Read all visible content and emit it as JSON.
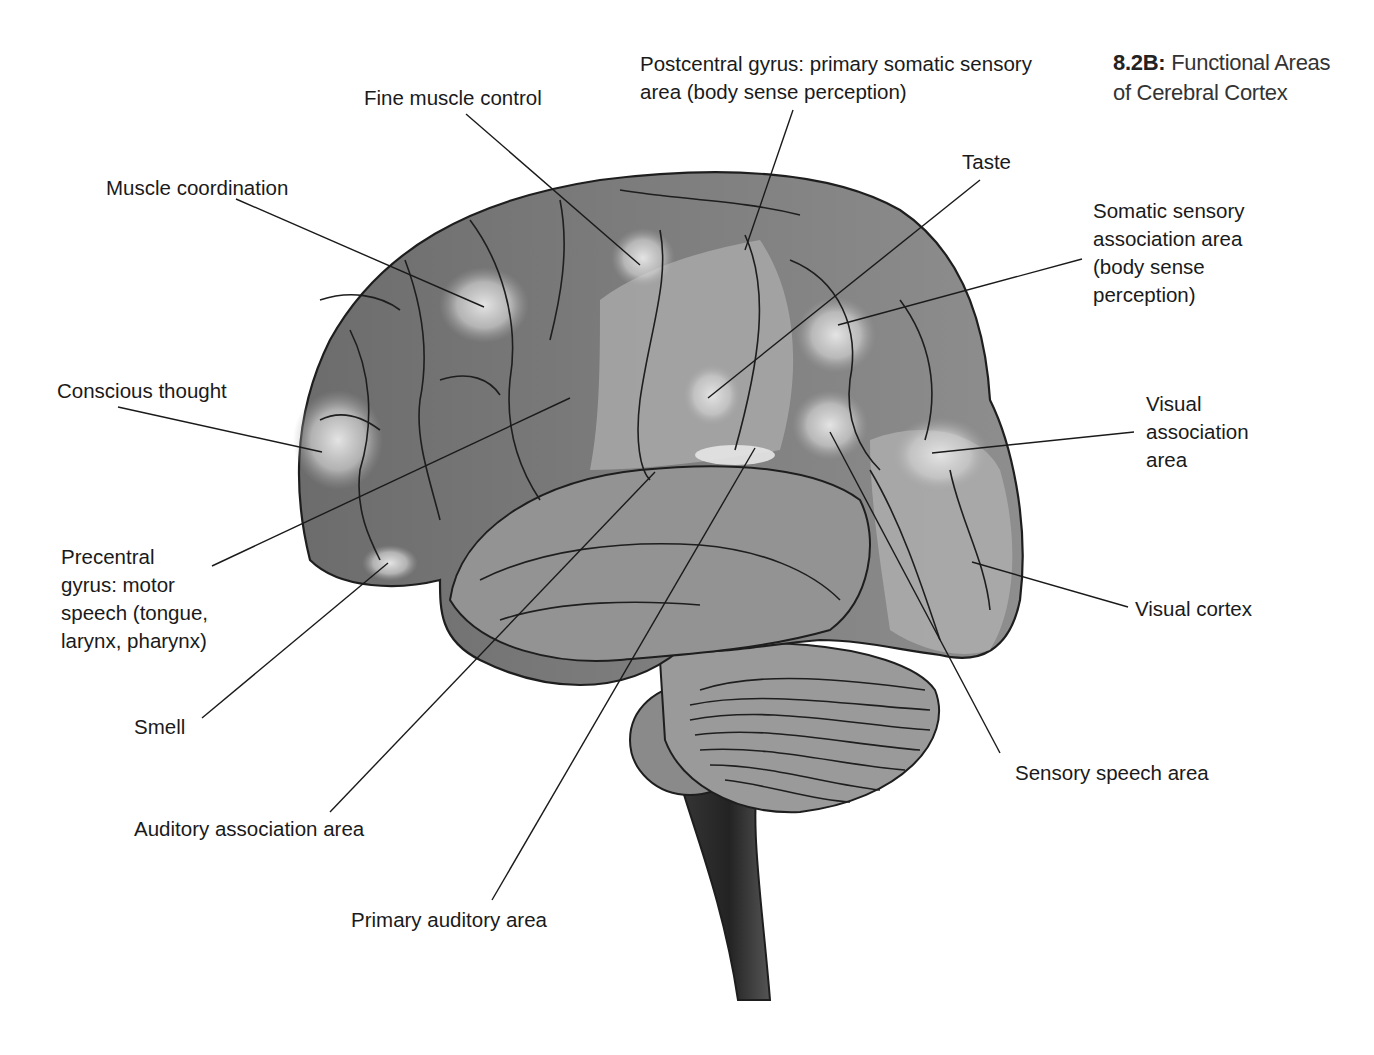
{
  "figure": {
    "number": "8.2B:",
    "title_line1": "Functional Areas",
    "title_line2": "of Cerebral Cortex"
  },
  "colors": {
    "cortex_dark": "#6e6e6e",
    "cortex_mid": "#8c8c8c",
    "cortex_light": "#b4b4b4",
    "highlight": "#d8d8d8",
    "brainstem": "#2e2e2e",
    "outline": "#1e1e1e",
    "leader": "#1a1a1a"
  },
  "labels": [
    {
      "id": "postcentral-gyrus",
      "text": "Postcentral gyrus: primary somatic sensory\narea (body sense perception)",
      "x": 640,
      "y": 50,
      "line": [
        [
          793,
          110
        ],
        [
          745,
          250
        ]
      ]
    },
    {
      "id": "fine-muscle-control",
      "text": "Fine muscle control",
      "x": 364,
      "y": 84,
      "line": [
        [
          466,
          114
        ],
        [
          640,
          265
        ]
      ]
    },
    {
      "id": "taste",
      "text": "Taste",
      "x": 962,
      "y": 148,
      "line": [
        [
          980,
          180
        ],
        [
          708,
          398
        ]
      ]
    },
    {
      "id": "muscle-coordination",
      "text": "Muscle coordination",
      "x": 106,
      "y": 174,
      "line": [
        [
          236,
          199
        ],
        [
          484,
          307
        ]
      ]
    },
    {
      "id": "somatic-sensory-association",
      "text": "Somatic sensory\nassociation area\n(body sense\nperception)",
      "x": 1093,
      "y": 197,
      "line": [
        [
          1082,
          259
        ],
        [
          838,
          325
        ]
      ]
    },
    {
      "id": "conscious-thought",
      "text": "Conscious thought",
      "x": 57,
      "y": 377,
      "line": [
        [
          118,
          407
        ],
        [
          322,
          452
        ]
      ]
    },
    {
      "id": "visual-association",
      "text": "Visual\nassociation\narea",
      "x": 1146,
      "y": 390,
      "line": [
        [
          1134,
          432
        ],
        [
          932,
          453
        ]
      ]
    },
    {
      "id": "precentral-gyrus",
      "text": "Precentral\ngyrus: motor\nspeech (tongue,\nlarynx, pharynx)",
      "x": 61,
      "y": 543,
      "line": [
        [
          212,
          566
        ],
        [
          570,
          398
        ]
      ]
    },
    {
      "id": "visual-cortex",
      "text": "Visual cortex",
      "x": 1135,
      "y": 595,
      "line": [
        [
          1128,
          607
        ],
        [
          972,
          562
        ]
      ]
    },
    {
      "id": "smell",
      "text": "Smell",
      "x": 134,
      "y": 713,
      "line": [
        [
          202,
          718
        ],
        [
          388,
          563
        ]
      ]
    },
    {
      "id": "sensory-speech",
      "text": "Sensory speech area",
      "x": 1015,
      "y": 759,
      "line": [
        [
          1000,
          753
        ],
        [
          830,
          432
        ]
      ]
    },
    {
      "id": "auditory-association",
      "text": "Auditory association area",
      "x": 134,
      "y": 815,
      "line": [
        [
          330,
          812
        ],
        [
          655,
          472
        ]
      ]
    },
    {
      "id": "primary-auditory",
      "text": "Primary auditory area",
      "x": 351,
      "y": 906,
      "line": [
        [
          492,
          900
        ],
        [
          755,
          448
        ]
      ]
    }
  ],
  "icons": {
    "brain": "brain-illustration-icon",
    "cerebellum": "cerebellum-icon",
    "brainstem": "brainstem-icon"
  }
}
